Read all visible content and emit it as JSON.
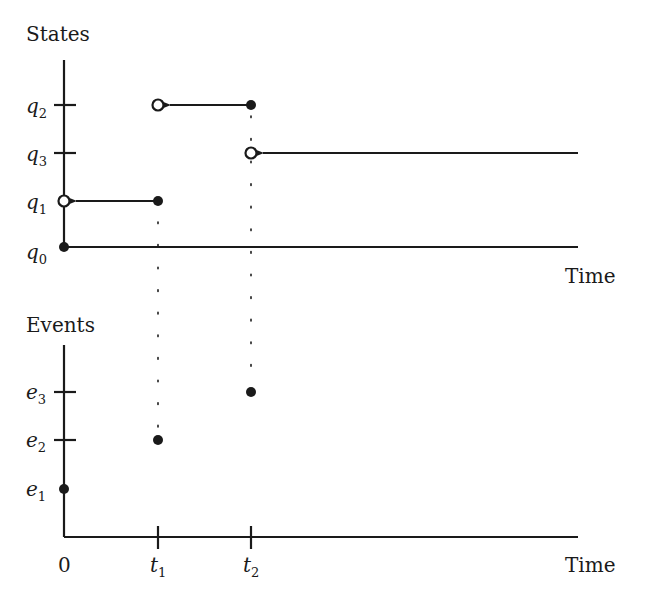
{
  "states_panel": {
    "title": "States",
    "x_label": "Time",
    "y_ticks": [
      {
        "base": "q",
        "sub": "2",
        "y": 105
      },
      {
        "base": "q",
        "sub": "3",
        "y": 153
      },
      {
        "base": "q",
        "sub": "1",
        "y": 201
      },
      {
        "base": "q",
        "sub": "0",
        "y": 247
      }
    ],
    "segments": [
      {
        "state": "q1",
        "from": "0",
        "to": "t1",
        "open_end": "0",
        "closed_end": "t1"
      },
      {
        "state": "q2",
        "from": "t1",
        "to": "t2",
        "open_end": "t1",
        "closed_end": "t2"
      },
      {
        "state": "q3",
        "from": "t2",
        "to": "inf",
        "open_end": "t2"
      },
      {
        "state": "q0",
        "at": "0",
        "closed_end": "0"
      }
    ]
  },
  "events_panel": {
    "title": "Events",
    "x_label": "Time",
    "y_ticks": [
      {
        "base": "e",
        "sub": "3",
        "y": 392
      },
      {
        "base": "e",
        "sub": "2",
        "y": 440
      },
      {
        "base": "e",
        "sub": "1",
        "y": 489
      }
    ],
    "x_ticks": [
      {
        "label": "0",
        "x": 64
      },
      {
        "base": "t",
        "sub": "1",
        "x": 158
      },
      {
        "base": "t",
        "sub": "2",
        "x": 251
      }
    ],
    "points": [
      {
        "event": "e1",
        "time": "0"
      },
      {
        "event": "e2",
        "time": "t1"
      },
      {
        "event": "e3",
        "time": "t2"
      }
    ]
  }
}
